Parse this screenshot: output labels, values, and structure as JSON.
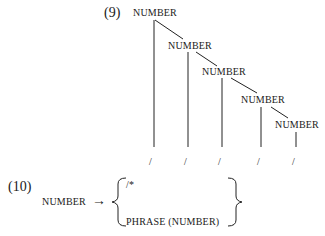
{
  "example9": {
    "number_label": "(9)",
    "nodes": [
      "NUMBER",
      "NUMBER",
      "NUMBER",
      "NUMBER",
      "NUMBER"
    ],
    "terminals": [
      "/",
      "/",
      "/",
      "/",
      "/"
    ]
  },
  "example10": {
    "number_label": "(10)",
    "lhs": "NUMBER",
    "arrow": "→",
    "option1": "/*",
    "option2": "PHRASE (NUMBER)"
  }
}
